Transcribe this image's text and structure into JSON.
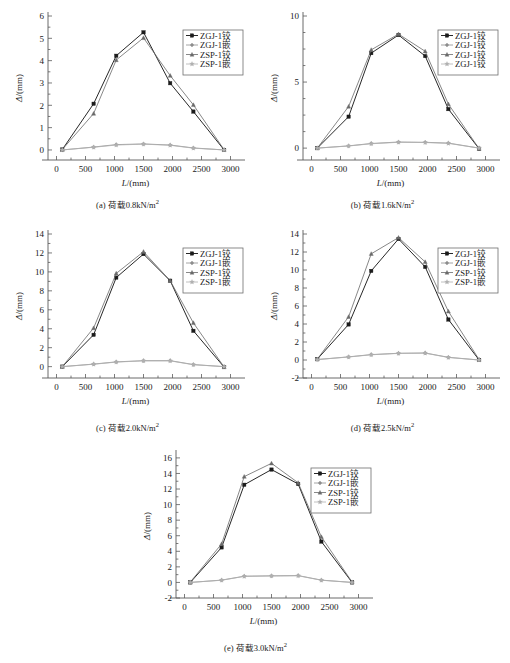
{
  "figure": {
    "title": "",
    "panel_count": 5
  },
  "common": {
    "xlabel_sym": "L",
    "xlabel_unit": "/(mm)",
    "ylabel_sym": "Δ",
    "ylabel_unit": "/(mm)",
    "xticks": [
      0,
      500,
      1000,
      1500,
      2000,
      2500,
      3000
    ],
    "xlim": [
      -250,
      3250
    ],
    "series_colors": [
      "#1b1b1b",
      "#8d8d8d",
      "#6a6a6a",
      "#b0b0b0"
    ],
    "legend_position": "right-upper"
  },
  "chart_data": [
    {
      "id": "a",
      "type": "line",
      "title": "",
      "caption_prefix": "(a)",
      "caption_text": "荷载0.8kN/m",
      "caption_sup": "2",
      "load": "0.8kN/m2",
      "xlabel": "L/(mm)",
      "ylabel": "Δ/(mm)",
      "x": [
        100,
        640,
        1030,
        1500,
        1960,
        2360,
        2890
      ],
      "xlim": [
        -250,
        3250
      ],
      "ylim": [
        -0.45,
        6.0
      ],
      "yticks": [
        0,
        1,
        2,
        3,
        4,
        5,
        6
      ],
      "yminor_step": 0.5,
      "grid": false,
      "legend": [
        "ZGJ-1铰",
        "ZGJ-1嵌",
        "ZSP-1铰",
        "ZSP-1嵌"
      ],
      "series": [
        {
          "name": "ZGJ-1铰",
          "values": [
            0.02,
            2.07,
            4.22,
            5.27,
            2.99,
            1.72,
            0.0
          ]
        },
        {
          "name": "ZGJ-1嵌",
          "values": [
            0.0,
            0.13,
            0.24,
            0.27,
            0.22,
            0.09,
            0.0
          ]
        },
        {
          "name": "ZSP-1铰",
          "values": [
            0.02,
            1.63,
            4.03,
            5.02,
            3.33,
            2.02,
            0.01
          ]
        },
        {
          "name": "ZSP-1嵌",
          "values": [
            0.0,
            0.12,
            0.22,
            0.26,
            0.21,
            0.08,
            0.0
          ]
        }
      ]
    },
    {
      "id": "b",
      "type": "line",
      "title": "",
      "caption_prefix": "(b)",
      "caption_text": "荷载1.6kN/m",
      "caption_sup": "2",
      "load": "1.6kN/m2",
      "xlabel": "L/(mm)",
      "ylabel": "Δ/(mm)",
      "x": [
        100,
        640,
        1030,
        1500,
        1960,
        2360,
        2890
      ],
      "xlim": [
        -250,
        3250
      ],
      "ylim": [
        -0.9,
        10.0
      ],
      "yticks": [
        0,
        5,
        10
      ],
      "yminor_step": 1.25,
      "grid": false,
      "legend": [
        "ZGJ-1铰",
        "ZGJ-1铰",
        "ZGJ-1铰",
        "ZGJ-1铰"
      ],
      "series": [
        {
          "name": "ZGJ-1铰",
          "values": [
            0.0,
            2.38,
            7.19,
            8.56,
            6.97,
            2.95,
            -0.05
          ]
        },
        {
          "name": "ZGJ-1铰 (2)",
          "values": [
            0.0,
            0.17,
            0.35,
            0.46,
            0.44,
            0.38,
            0.0
          ]
        },
        {
          "name": "ZGJ-1铰 (3)",
          "values": [
            0.0,
            3.15,
            7.44,
            8.63,
            7.33,
            3.33,
            -0.04
          ]
        },
        {
          "name": "ZGJ-1铰 (4)",
          "values": [
            0.0,
            0.16,
            0.33,
            0.44,
            0.42,
            0.36,
            0.0
          ]
        }
      ]
    },
    {
      "id": "c",
      "type": "line",
      "title": "",
      "caption_prefix": "(c)",
      "caption_text": "荷载2.0kN/m",
      "caption_sup": "2",
      "load": "2.0kN/m2",
      "xlabel": "L/(mm)",
      "ylabel": "Δ/(mm)",
      "x": [
        100,
        640,
        1030,
        1500,
        1960,
        2360,
        2890
      ],
      "xlim": [
        -250,
        3250
      ],
      "ylim": [
        -1.2,
        14.0
      ],
      "yticks": [
        0,
        2,
        4,
        6,
        8,
        10,
        12,
        14
      ],
      "yminor_step": 1,
      "grid": false,
      "legend": [
        "ZGJ-1铰",
        "ZGJ-1嵌",
        "ZSP-1铰",
        "ZSP-1嵌"
      ],
      "series": [
        {
          "name": "ZGJ-1铰",
          "values": [
            0.0,
            3.36,
            9.4,
            11.88,
            9.07,
            3.78,
            -0.05
          ]
        },
        {
          "name": "ZGJ-1嵌",
          "values": [
            0.0,
            0.27,
            0.5,
            0.63,
            0.63,
            0.22,
            0.0
          ]
        },
        {
          "name": "ZSP-1铰",
          "values": [
            0.0,
            4.08,
            9.84,
            12.13,
            9.07,
            4.62,
            -0.04
          ]
        },
        {
          "name": "ZSP-1嵌",
          "values": [
            0.0,
            0.25,
            0.48,
            0.61,
            0.61,
            0.2,
            0.0
          ]
        }
      ]
    },
    {
      "id": "d",
      "type": "line",
      "title": "",
      "caption_prefix": "(d)",
      "caption_text": "荷载2.5kN/m",
      "caption_sup": "2",
      "load": "2.5kN/m2",
      "xlabel": "L/(mm)",
      "ylabel": "Δ/(mm)",
      "x": [
        100,
        640,
        1030,
        1500,
        1960,
        2360,
        2890
      ],
      "xlim": [
        -250,
        3250
      ],
      "ylim": [
        -2.0,
        14.0
      ],
      "yticks": [
        -2,
        0,
        2,
        4,
        6,
        8,
        10,
        12,
        14
      ],
      "yminor_step": 1,
      "grid": false,
      "legend": [
        "ZGJ-1铰",
        "ZGJ-1嵌",
        "ZSP-1铰",
        "ZSP-1嵌"
      ],
      "series": [
        {
          "name": "ZGJ-1铰",
          "values": [
            0.1,
            3.95,
            9.9,
            13.45,
            10.35,
            4.5,
            0.0
          ]
        },
        {
          "name": "ZGJ-1嵌",
          "values": [
            0.05,
            0.35,
            0.6,
            0.75,
            0.78,
            0.3,
            0.0
          ]
        },
        {
          "name": "ZSP-1铰",
          "values": [
            0.1,
            4.8,
            11.8,
            13.6,
            10.9,
            5.4,
            0.05
          ]
        },
        {
          "name": "ZSP-1嵌",
          "values": [
            0.05,
            0.33,
            0.58,
            0.73,
            0.76,
            0.28,
            0.0
          ]
        }
      ]
    },
    {
      "id": "e",
      "type": "line",
      "title": "",
      "caption_prefix": "(e)",
      "caption_text": "荷载3.0kN/m",
      "caption_sup": "2",
      "load": "3.0kN/m2",
      "xlabel": "L/(mm)",
      "ylabel": "Δ/(mm)",
      "x": [
        100,
        640,
        1030,
        1500,
        1960,
        2360,
        2890
      ],
      "xlim": [
        -250,
        3250
      ],
      "ylim": [
        -2.0,
        16.5
      ],
      "yticks": [
        -2,
        0,
        2,
        4,
        6,
        8,
        10,
        12,
        14,
        16
      ],
      "yminor_step": 1,
      "grid": false,
      "legend": [
        "ZGJ-1铰",
        "ZGJ-1嵌",
        "ZSP-1铰",
        "ZSP-1嵌"
      ],
      "series": [
        {
          "name": "ZGJ-1铰",
          "values": [
            0.0,
            4.5,
            12.55,
            14.5,
            12.65,
            5.25,
            0.0
          ]
        },
        {
          "name": "ZGJ-1嵌",
          "values": [
            0.0,
            0.3,
            0.8,
            0.85,
            0.88,
            0.3,
            0.0
          ]
        },
        {
          "name": "ZSP-1铰",
          "values": [
            0.05,
            4.95,
            13.6,
            15.3,
            12.8,
            5.85,
            0.05
          ]
        },
        {
          "name": "ZSP-1嵌",
          "values": [
            0.0,
            0.28,
            0.78,
            0.83,
            0.86,
            0.28,
            0.0
          ]
        }
      ]
    }
  ]
}
